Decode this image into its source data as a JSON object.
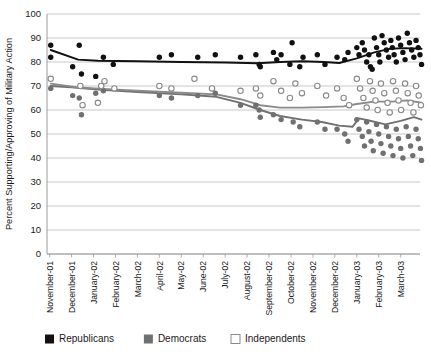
{
  "chart_data": {
    "type": "scatter",
    "title": "",
    "xlabel": "",
    "ylabel": "Percent Supporting/Approving of Military Action",
    "ylim": [
      0,
      100
    ],
    "ytick_step": 10,
    "yticks": [
      "0",
      "10",
      "20",
      "30",
      "40",
      "50",
      "60",
      "70",
      "80",
      "90",
      "100"
    ],
    "grid": true,
    "legend_position": "bottom",
    "categories": [
      "November-01",
      "December-01",
      "January-02",
      "February-02",
      "March-02",
      "April-02",
      "May-02",
      "June-02",
      "July-02",
      "August-02",
      "September-02",
      "October-02",
      "November-02",
      "December-02",
      "January-03",
      "February-03",
      "March-03"
    ],
    "colors": {
      "republicans": "#111111",
      "democrats": "#707070",
      "independents": "#ffffff",
      "independents_edge": "#8a8a8a",
      "gridline": "#b9b9b9",
      "axis": "#9a9a9a",
      "text": "#1a1a1a"
    },
    "series": [
      {
        "name": "Republicans",
        "marker": "filled-circle",
        "color": "#111111",
        "points": [
          [
            0.05,
            87
          ],
          [
            0.05,
            82
          ],
          [
            1.05,
            78
          ],
          [
            1.35,
            87
          ],
          [
            1.45,
            75
          ],
          [
            2.1,
            74
          ],
          [
            2.45,
            82
          ],
          [
            2.9,
            79
          ],
          [
            5.0,
            82
          ],
          [
            5.55,
            83
          ],
          [
            6.75,
            82
          ],
          [
            7.55,
            83
          ],
          [
            8.7,
            82
          ],
          [
            9.4,
            83
          ],
          [
            9.55,
            79
          ],
          [
            9.6,
            78
          ],
          [
            10.2,
            84
          ],
          [
            10.35,
            81
          ],
          [
            10.55,
            83
          ],
          [
            10.95,
            79
          ],
          [
            11.05,
            88
          ],
          [
            11.4,
            78
          ],
          [
            11.55,
            82
          ],
          [
            12.2,
            83
          ],
          [
            12.55,
            79
          ],
          [
            13.1,
            82
          ],
          [
            13.45,
            81
          ],
          [
            13.6,
            84
          ],
          [
            14.0,
            86
          ],
          [
            14.1,
            83
          ],
          [
            14.25,
            88
          ],
          [
            14.35,
            85
          ],
          [
            14.45,
            80
          ],
          [
            14.55,
            83
          ],
          [
            14.62,
            78
          ],
          [
            14.7,
            77
          ],
          [
            14.8,
            90
          ],
          [
            14.9,
            86
          ],
          [
            15.0,
            83
          ],
          [
            15.05,
            80
          ],
          [
            15.15,
            91
          ],
          [
            15.25,
            88
          ],
          [
            15.35,
            85
          ],
          [
            15.45,
            82
          ],
          [
            15.55,
            89
          ],
          [
            15.62,
            86
          ],
          [
            15.7,
            83
          ],
          [
            15.8,
            80
          ],
          [
            15.9,
            90
          ],
          [
            16.0,
            87
          ],
          [
            16.1,
            84
          ],
          [
            16.2,
            81
          ],
          [
            16.3,
            92
          ],
          [
            16.4,
            88
          ],
          [
            16.5,
            85
          ],
          [
            16.6,
            82
          ],
          [
            16.7,
            89
          ],
          [
            16.8,
            86
          ],
          [
            16.88,
            83
          ],
          [
            16.95,
            79
          ]
        ],
        "trend": [
          [
            0.05,
            85
          ],
          [
            1.3,
            81
          ],
          [
            2.2,
            80.5
          ],
          [
            4.0,
            80.3
          ],
          [
            6.0,
            80.0
          ],
          [
            8.0,
            79.8
          ],
          [
            9.5,
            79.5
          ],
          [
            10.5,
            80.0
          ],
          [
            11.5,
            80.3
          ],
          [
            12.5,
            80.0
          ],
          [
            13.2,
            79.6
          ],
          [
            14.0,
            81.5
          ],
          [
            14.8,
            84.0
          ],
          [
            15.5,
            85.5
          ],
          [
            16.2,
            85.8
          ],
          [
            16.95,
            85.5
          ]
        ]
      },
      {
        "name": "Democrats",
        "marker": "filled-circle",
        "color": "#707070",
        "points": [
          [
            0.05,
            69
          ],
          [
            1.05,
            66
          ],
          [
            1.35,
            65
          ],
          [
            1.45,
            58
          ],
          [
            2.1,
            67
          ],
          [
            2.45,
            68
          ],
          [
            5.0,
            66
          ],
          [
            5.55,
            65
          ],
          [
            6.75,
            66
          ],
          [
            7.55,
            67
          ],
          [
            8.7,
            62
          ],
          [
            9.4,
            62
          ],
          [
            9.55,
            60
          ],
          [
            9.6,
            57
          ],
          [
            10.2,
            58
          ],
          [
            10.55,
            56
          ],
          [
            11.1,
            55
          ],
          [
            11.4,
            53
          ],
          [
            12.2,
            55
          ],
          [
            12.55,
            52
          ],
          [
            13.1,
            52
          ],
          [
            13.45,
            50
          ],
          [
            13.6,
            47
          ],
          [
            14.0,
            56
          ],
          [
            14.1,
            52
          ],
          [
            14.25,
            49
          ],
          [
            14.35,
            45
          ],
          [
            14.45,
            55
          ],
          [
            14.55,
            51
          ],
          [
            14.65,
            47
          ],
          [
            14.75,
            43
          ],
          [
            14.9,
            54
          ],
          [
            15.0,
            50
          ],
          [
            15.1,
            46
          ],
          [
            15.2,
            42
          ],
          [
            15.35,
            53
          ],
          [
            15.45,
            49
          ],
          [
            15.55,
            45
          ],
          [
            15.65,
            41
          ],
          [
            15.8,
            52
          ],
          [
            15.9,
            48
          ],
          [
            16.0,
            44
          ],
          [
            16.1,
            40
          ],
          [
            16.25,
            53
          ],
          [
            16.35,
            49
          ],
          [
            16.45,
            45
          ],
          [
            16.55,
            41
          ],
          [
            16.7,
            52
          ],
          [
            16.8,
            48
          ],
          [
            16.9,
            44
          ],
          [
            16.95,
            39
          ]
        ],
        "trend": [
          [
            0.05,
            70
          ],
          [
            1.0,
            69.5
          ],
          [
            2.2,
            68.5
          ],
          [
            4.0,
            67.5
          ],
          [
            6.0,
            66.5
          ],
          [
            7.6,
            65.5
          ],
          [
            8.7,
            63.0
          ],
          [
            9.6,
            60.0
          ],
          [
            10.5,
            57.5
          ],
          [
            11.5,
            56.0
          ],
          [
            12.4,
            55.0
          ],
          [
            13.2,
            53.5
          ],
          [
            13.8,
            53.0
          ],
          [
            14.1,
            56.5
          ],
          [
            14.6,
            55.5
          ],
          [
            15.3,
            54.0
          ],
          [
            16.0,
            55.5
          ],
          [
            16.6,
            57.0
          ],
          [
            16.95,
            56.0
          ]
        ]
      },
      {
        "name": "Independents",
        "marker": "open-circle",
        "color": "#ffffff",
        "points": [
          [
            0.05,
            73
          ],
          [
            1.4,
            70
          ],
          [
            1.5,
            62
          ],
          [
            2.35,
            70
          ],
          [
            2.5,
            72
          ],
          [
            2.95,
            69
          ],
          [
            2.2,
            63
          ],
          [
            5.0,
            70
          ],
          [
            5.55,
            69
          ],
          [
            6.6,
            73
          ],
          [
            7.4,
            69
          ],
          [
            8.7,
            68
          ],
          [
            9.4,
            69
          ],
          [
            9.6,
            66
          ],
          [
            10.2,
            72
          ],
          [
            10.55,
            68
          ],
          [
            10.95,
            65
          ],
          [
            11.2,
            71
          ],
          [
            11.5,
            67
          ],
          [
            12.2,
            70
          ],
          [
            12.6,
            66
          ],
          [
            13.1,
            69
          ],
          [
            13.4,
            65
          ],
          [
            13.65,
            62
          ],
          [
            14.0,
            73
          ],
          [
            14.15,
            69
          ],
          [
            14.3,
            65
          ],
          [
            14.45,
            61
          ],
          [
            14.6,
            72
          ],
          [
            14.72,
            68
          ],
          [
            14.85,
            64
          ],
          [
            14.95,
            60
          ],
          [
            15.1,
            71
          ],
          [
            15.25,
            67
          ],
          [
            15.4,
            63
          ],
          [
            15.5,
            59
          ],
          [
            15.65,
            72
          ],
          [
            15.78,
            68
          ],
          [
            15.9,
            64
          ],
          [
            16.02,
            60
          ],
          [
            16.2,
            71
          ],
          [
            16.32,
            67
          ],
          [
            16.45,
            63
          ],
          [
            16.58,
            59
          ],
          [
            16.7,
            70
          ],
          [
            16.82,
            66
          ],
          [
            16.92,
            62
          ]
        ],
        "trend": [
          [
            0.05,
            71
          ],
          [
            1.2,
            69.5
          ],
          [
            2.4,
            68.8
          ],
          [
            4.0,
            68.0
          ],
          [
            6.0,
            67.2
          ],
          [
            7.6,
            66.5
          ],
          [
            8.7,
            64.5
          ],
          [
            9.6,
            62.0
          ],
          [
            10.5,
            61.0
          ],
          [
            11.5,
            61.0
          ],
          [
            12.5,
            61.2
          ],
          [
            13.4,
            61.5
          ],
          [
            14.0,
            62.5
          ],
          [
            14.8,
            63.5
          ],
          [
            15.6,
            63.5
          ],
          [
            16.3,
            64.0
          ],
          [
            16.95,
            63.0
          ]
        ]
      }
    ],
    "legend": [
      {
        "label": "Republicans",
        "style": "filled",
        "color": "#111111"
      },
      {
        "label": "Democrats",
        "style": "filled",
        "color": "#707070"
      },
      {
        "label": "Independents",
        "style": "open",
        "color": "#ffffff"
      }
    ]
  },
  "source_note": ""
}
